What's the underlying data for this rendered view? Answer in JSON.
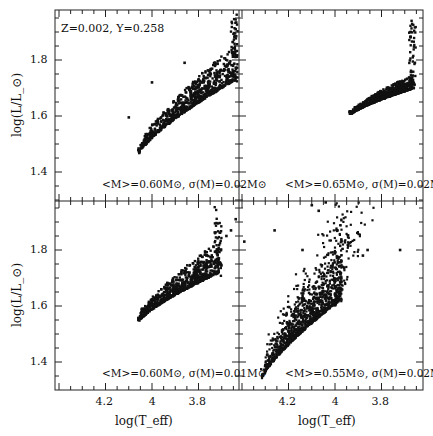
{
  "chart_data": {
    "type": "scatter",
    "layout": "2x2 shared axes",
    "xlabel": "log(T_eff)",
    "ylabel": "log(L/L_⊙)",
    "x_axis_reversed": true,
    "xlim": [
      4.41,
      3.62
    ],
    "ylim": [
      1.32,
      1.98
    ],
    "xticks": [
      "4.2",
      "4",
      "3.8"
    ],
    "yticks": [
      "1.4",
      "1.6",
      "1.8"
    ],
    "grid": false,
    "legend": "none",
    "panels": [
      {
        "position": "top-left",
        "annotation_top": "Z=0.002, Y=0.258",
        "annotation_bottom": "<M>=0.60M⊙, σ(M)=0.02M⊙",
        "mean_mass": 0.6,
        "sigma_mass": 0.02,
        "gen": {
          "x0": 4.06,
          "y0": 1.46,
          "x1": 3.64,
          "y1": 1.73,
          "curv": 0.55,
          "spread": 0.1,
          "tail": 0.22,
          "n": 900,
          "seed": 11
        },
        "outliers": [
          [
            4.1,
            1.595
          ],
          [
            4.0,
            1.72
          ],
          [
            3.86,
            1.79
          ],
          [
            3.63,
            1.95
          ],
          [
            3.64,
            1.91
          ]
        ]
      },
      {
        "position": "top-right",
        "annotation_bottom": "<M>=0.65M⊙, σ(M)=0.02M⊙",
        "mean_mass": 0.65,
        "sigma_mass": 0.02,
        "gen": {
          "x0": 3.94,
          "y0": 1.6,
          "x1": 3.66,
          "y1": 1.7,
          "curv": 0.3,
          "spread": 0.04,
          "tail": 0.23,
          "n": 800,
          "seed": 23
        },
        "outliers": [
          [
            3.83,
            1.67
          ],
          [
            3.8,
            1.66
          ],
          [
            3.74,
            1.7
          ]
        ]
      },
      {
        "position": "bottom-left",
        "annotation_bottom": "<M>=0.60M⊙, σ(M)=0.01M⊙",
        "mean_mass": 0.6,
        "sigma_mass": 0.01,
        "gen": {
          "x0": 4.06,
          "y0": 1.54,
          "x1": 3.71,
          "y1": 1.72,
          "curv": 0.15,
          "spread": 0.09,
          "tail": 0.16,
          "n": 800,
          "seed": 37
        },
        "outliers": [
          [
            3.64,
            1.91
          ],
          [
            3.66,
            1.87
          ],
          [
            3.68,
            1.85
          ]
        ]
      },
      {
        "position": "bottom-right",
        "annotation_bottom": "<M>=0.55M⊙, σ(M)=0.02M⊙",
        "mean_mass": 0.55,
        "sigma_mass": 0.02,
        "gen": {
          "x0": 4.32,
          "y0": 1.33,
          "x1": 3.98,
          "y1": 1.62,
          "curv": 0.35,
          "spread": 0.3,
          "tail": 0.05,
          "n": 1300,
          "seed": 53
        },
        "outliers": [
          [
            4.39,
            1.83
          ],
          [
            4.26,
            1.87
          ],
          [
            4.14,
            1.8
          ],
          [
            4.1,
            1.96
          ],
          [
            4.07,
            1.94
          ],
          [
            3.86,
            1.8
          ],
          [
            3.72,
            1.8
          ],
          [
            3.88,
            1.78
          ],
          [
            4.04,
            1.97
          ]
        ]
      }
    ]
  },
  "colors": {
    "point": "#111111",
    "axis": "#222222",
    "background": "#ffffff"
  }
}
